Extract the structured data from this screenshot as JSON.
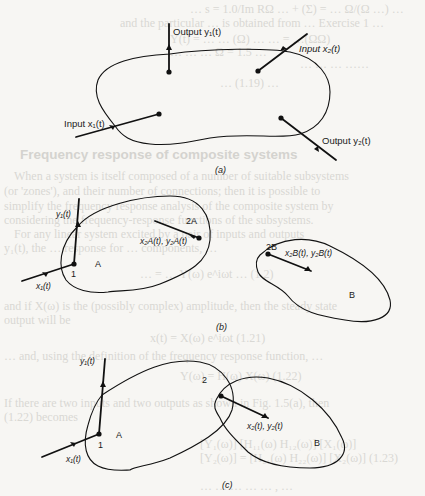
{
  "background_text": {
    "lines": [
      {
        "text": "… s = 1.0/Im RΩ … + (Σ) = … Ω/(Ω …) …",
        "x": 190,
        "y": 3
      },
      {
        "text": "and the particular … is obtained from … Exercise 1 …",
        "x": 120,
        "y": 17
      },
      {
        "text": "Y(t) = …        … (Ω) …  … = …(ΩΩ)",
        "x": 170,
        "y": 33
      },
      {
        "text": "…                …       …  Ω = 1.5 …",
        "x": 170,
        "y": 46
      },
      {
        "text": "…  …  …  ……",
        "x": 300,
        "y": 58
      },
      {
        "text": "… (1.19) …",
        "x": 220,
        "y": 77
      },
      {
        "text": "Frequency response of composite systems",
        "x": 20,
        "y": 148,
        "head": true
      },
      {
        "text": "When a system is itself composed of a number of suitable subsystems",
        "x": 14,
        "y": 170
      },
      {
        "text": "(or 'zones'), and their number of connections; then it is possible to",
        "x": 4,
        "y": 185
      },
      {
        "text": "simplify the frequency response analysis of the composite system by",
        "x": 4,
        "y": 200
      },
      {
        "text": "considering the frequency-response functions of the subsystems.",
        "x": 4,
        "y": 214
      },
      {
        "text": "For any linear system excited by a pair of inputs and outputs",
        "x": 14,
        "y": 228
      },
      {
        "text": "y₁(t), the … response for … components, …",
        "x": 4,
        "y": 242
      },
      {
        "text": "… = … Y(ω) e^iωt …              (1.2)",
        "x": 140,
        "y": 268
      },
      {
        "text": "and if X(ω) is the (possibly complex) amplitude, then the steady state",
        "x": 4,
        "y": 300
      },
      {
        "text": "output will be",
        "x": 4,
        "y": 314
      },
      {
        "text": "x(t) = X(ω) e^iωt                              (1.21)",
        "x": 150,
        "y": 332
      },
      {
        "text": "… and, using the definition of the frequency response function, …",
        "x": 4,
        "y": 350
      },
      {
        "text": "Y(ω) = H(ω) X(ω)                    (1.22)",
        "x": 180,
        "y": 370
      },
      {
        "text": "If there are two inputs and two outputs as shown in Fig. 1.5(a), then",
        "x": 4,
        "y": 397
      },
      {
        "text": "(1.22) becomes",
        "x": 4,
        "y": 411
      },
      {
        "text": "[Y₁(ω)]   [H₁₁(ω)  H₁₂(ω)] [X₁(ω)]",
        "x": 200,
        "y": 438
      },
      {
        "text": "[Y₂(ω)] = [H₂₁(ω)  H₂₂(ω)] [X₂(ω)]     (1.23)",
        "x": 200,
        "y": 452
      },
      {
        "text": "… … … …  … , …",
        "x": 200,
        "y": 480
      }
    ]
  },
  "figure": {
    "a": {
      "caption": "(a)",
      "output_y1": "Output y₁(t)",
      "input_x2": "Input x₂(t)",
      "input_x1": "Input x₁(t)",
      "output_y2": "Output y₂(t)"
    },
    "b": {
      "caption": "(b)",
      "y1": "y₁(t)",
      "x1": "x₁(t)",
      "point_1": "1",
      "region_A": "A",
      "point_2A": "2A",
      "x2A_y2A": "x₂A(t), y₂A(t)",
      "point_2B": "2B",
      "x2B_y2B": "x₂B(t), y₂B(t)",
      "region_B": "B"
    },
    "c": {
      "caption": "(c)",
      "y1": "y₁(t)",
      "x1": "x₁(t)",
      "point_1": "1",
      "region_A": "A",
      "point_2": "2",
      "x2_y2": "x₂(t), y₂(t)",
      "region_B": "B"
    }
  }
}
